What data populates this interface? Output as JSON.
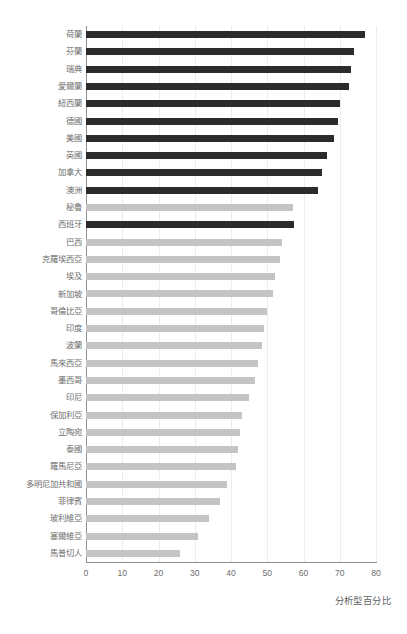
{
  "chart_data": {
    "type": "bar",
    "orientation": "horizontal",
    "title": "",
    "subtitle": "",
    "xlabel": "分析型百分比",
    "ylabel": "",
    "xlim": [
      0,
      80
    ],
    "xticks": [
      0,
      10,
      20,
      30,
      40,
      50,
      60,
      70,
      80
    ],
    "xtick_labels": [
      "0",
      "10",
      "20",
      "30",
      "40",
      "50",
      "60",
      "70",
      "80"
    ],
    "grid": true,
    "grid_axis": "x",
    "legend": null,
    "categories": [
      "荷蘭",
      "芬蘭",
      "瑞典",
      "愛爾蘭",
      "紐西蘭",
      "德國",
      "美國",
      "英國",
      "加拿大",
      "澳洲",
      "秘魯",
      "西班牙",
      "巴西",
      "克羅埃西亞",
      "埃及",
      "新加坡",
      "哥倫比亞",
      "印度",
      "波蘭",
      "馬來西亞",
      "墨西哥",
      "印尼",
      "保加利亞",
      "立陶宛",
      "泰國",
      "羅馬尼亞",
      "多明尼加共和國",
      "菲律賓",
      "玻利維亞",
      "塞爾維亞",
      "馬普切人"
    ],
    "values": [
      77,
      74,
      73,
      72.5,
      70,
      69.5,
      68.5,
      66.5,
      65,
      64,
      57,
      57.5,
      54,
      53.5,
      52,
      51.5,
      50,
      49,
      48.5,
      47.5,
      46.5,
      45,
      43,
      42.5,
      42,
      41.5,
      39,
      37,
      34,
      31,
      26
    ],
    "series": [
      {
        "name": "分析型百分比",
        "values": [
          77,
          74,
          73,
          72.5,
          70,
          69.5,
          68.5,
          66.5,
          65,
          64,
          57,
          57.5,
          54,
          53.5,
          52,
          51.5,
          50,
          49,
          48.5,
          47.5,
          46.5,
          45,
          43,
          42.5,
          42,
          41.5,
          39,
          37,
          34,
          31,
          26
        ]
      }
    ],
    "highlighted_indices": [
      0,
      1,
      2,
      3,
      4,
      5,
      6,
      7,
      8,
      9,
      11
    ],
    "colors": {
      "highlight_bar": "#2b2b2b",
      "normal_bar": "#c4c4c4",
      "gridline": "#ececec",
      "axis": "#8f8f8f",
      "label_text": "#6e6e6e",
      "background": "#ffffff"
    }
  }
}
